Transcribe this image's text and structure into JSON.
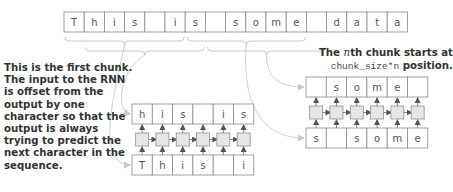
{
  "colors": {
    "cell_border": "#8a8a8a",
    "cell_text": "#555555",
    "rnn_fill": "#e6e6e6",
    "rnn_border": "#8f8f8f",
    "arrow": "#555555",
    "curve": "#c8c8c8",
    "brace": "#c4c4c4",
    "note_text": "#333333"
  },
  "sequence": {
    "cells": [
      "T",
      "h",
      "i",
      "s",
      " ",
      "i",
      "s",
      " ",
      "s",
      "o",
      "m",
      "e",
      " ",
      "d",
      "a",
      "t",
      "a"
    ]
  },
  "chunk1": {
    "output": [
      "h",
      "i",
      "s",
      " ",
      "i",
      "s"
    ],
    "input": [
      "T",
      "h",
      "i",
      "s",
      " ",
      "i"
    ]
  },
  "chunk2": {
    "output": [
      " ",
      "s",
      "o",
      "m",
      "e",
      " "
    ],
    "input": [
      "s",
      " ",
      "s",
      "o",
      "m",
      "e"
    ]
  },
  "notes": {
    "left": "This is the first chunk. The input to the RNN is offset from the output by one character so that the output is always trying to predict the next character in the sequence.",
    "right_prefix": "The ",
    "right_n": "n",
    "right_mid": "th chunk starts at",
    "right_code": "chunk_size*n",
    "right_suffix": " position."
  }
}
